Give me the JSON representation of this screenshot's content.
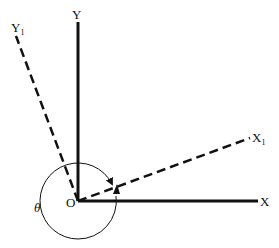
{
  "diagram": {
    "labels": {
      "y": "Y",
      "x": "X",
      "origin": "O",
      "y1": "Y",
      "y1_sub": "1",
      "x1": "X",
      "x1_sub": "1",
      "angle": "θ"
    },
    "colors": {
      "line": "#111111",
      "background": "#ffffff"
    }
  }
}
